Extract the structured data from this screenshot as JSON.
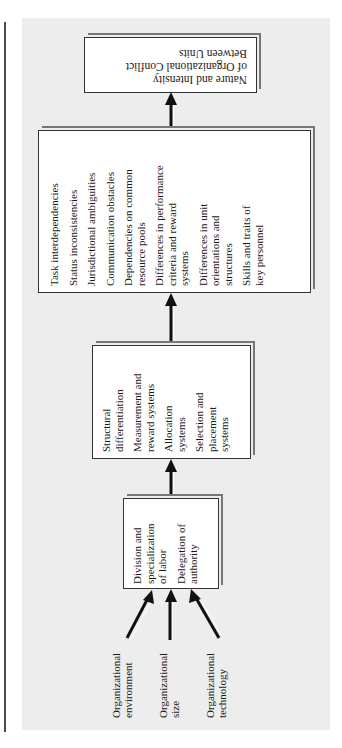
{
  "diagram": {
    "orientation": "rotated-90-counterclockwise",
    "inputs": [
      {
        "label_line1": "Organizational",
        "label_line2": "environment"
      },
      {
        "label_line1": "Organizational",
        "label_line2": "size"
      },
      {
        "label_line1": "Organizational",
        "label_line2": "technology"
      }
    ],
    "stage1": {
      "items": [
        {
          "line1": "Division and",
          "line2": "specialization",
          "line3": "of labor"
        },
        {
          "line1": "Delegation of",
          "line2": "authority"
        }
      ]
    },
    "stage2": {
      "items": [
        {
          "line1": "Structural",
          "line2": "differentiation"
        },
        {
          "line1": "Measurement and",
          "line2": "reward systems"
        },
        {
          "line1": "Allocation",
          "line2": "systems"
        },
        {
          "line1": "Selection and",
          "line2": "placement",
          "line3": "systems"
        }
      ]
    },
    "stage3": {
      "items": [
        {
          "line1": "Task interdependencies"
        },
        {
          "line1": "Status inconsistencies"
        },
        {
          "line1": "Jurisdictional ambiguities"
        },
        {
          "line1": "Communication obstacles"
        },
        {
          "line1": "Dependencies on common",
          "line2": "resource pools"
        },
        {
          "line1": "Differences in performance",
          "line2": "criteria and reward",
          "line3": "systems"
        },
        {
          "line1": "Differences in unit",
          "line2": "orientations and",
          "line3": "structures"
        },
        {
          "line1": "Skills and traits of",
          "line2": "key personnel"
        }
      ]
    },
    "outcome": {
      "line1": "Nature and Intensity",
      "line2": "of Organizational Conflict",
      "line3": "Between Units"
    },
    "colors": {
      "panel": "#ededed",
      "box": "#ffffff",
      "border": "#333333",
      "arrow": "#111111"
    }
  }
}
